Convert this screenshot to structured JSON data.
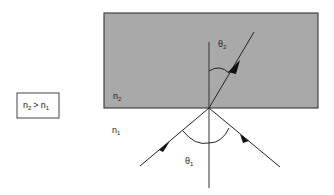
{
  "diagram": {
    "condition_box": {
      "n_left": "n",
      "sub_left": "2",
      "op": ">",
      "n_right": "n",
      "sub_right": "1"
    },
    "medium2": {
      "label": "n",
      "sub": "2",
      "fill": "#a9a9a9"
    },
    "medium1": {
      "label": "n",
      "sub": "1"
    },
    "angle_refracted": {
      "symbol": "θ",
      "sub": "2"
    },
    "angle_incident": {
      "symbol": "θ",
      "sub": "1"
    },
    "rays": [
      "incident",
      "reflected",
      "refracted"
    ],
    "normal": "vertical normal line at interface point"
  }
}
